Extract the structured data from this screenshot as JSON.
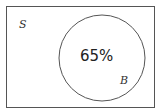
{
  "diagram": {
    "type": "venn",
    "universe_label": "S",
    "set_label": "B",
    "set_value": "65%",
    "stroke_color": "#555555"
  }
}
